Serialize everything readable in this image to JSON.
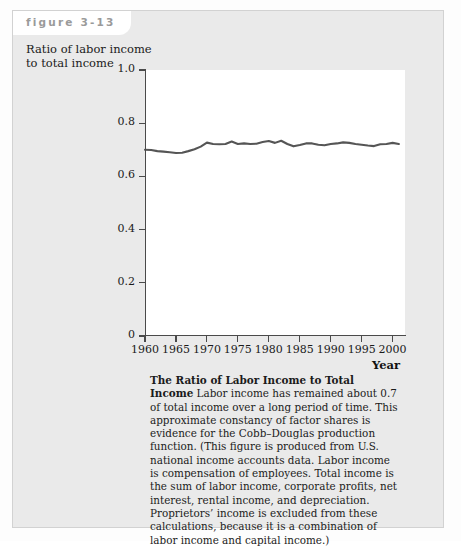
{
  "figure": {
    "label": "figure 3-13"
  },
  "axis_title_y": "Ratio of labor income\nto total income",
  "axis_title_x": "Year",
  "caption": {
    "lead": "The Ratio of Labor Income to Total Income",
    "body": " Labor income has remained about 0.7 of total income over a long period of time. This approximate constancy of factor shares is evidence for the Cobb–Douglas production function. (This figure is produced from U.S. national income accounts data. Labor income is compensation of employees. Total income is the sum of labor income, corporate profits, net interest, rental income, and depreciation. Proprietors’ income is excluded from these calculations, because it is a combination of labor income and capital income.)"
  },
  "colors": {
    "panel_background": "#eaeaea",
    "plot_background": "#ffffff",
    "axis": "#4a4a4a",
    "line": "#555555",
    "figure_label": "#9a9a9a"
  },
  "chart_data": {
    "type": "line",
    "title": "The Ratio of Labor Income to Total Income",
    "xlabel": "Year",
    "ylabel": "Ratio of labor income to total income",
    "xlim": [
      1960,
      2002
    ],
    "ylim": [
      0,
      1.0
    ],
    "grid": false,
    "legend": "none",
    "xticks": [
      1960,
      1965,
      1970,
      1975,
      1980,
      1985,
      1990,
      1995,
      2000
    ],
    "xticklabels": [
      "1960",
      "1965",
      "1970",
      "1975",
      "1980",
      "1985",
      "1990",
      "1995",
      "2000"
    ],
    "yticks": [
      0,
      0.2,
      0.4,
      0.6,
      0.8,
      1.0
    ],
    "yticklabels": [
      "0",
      "0.2",
      "0.4",
      "0.6",
      "0.8",
      "1.0"
    ],
    "series": [
      {
        "name": "Labor income share",
        "x": [
          1960,
          1961,
          1962,
          1963,
          1964,
          1965,
          1966,
          1967,
          1968,
          1969,
          1970,
          1971,
          1972,
          1973,
          1974,
          1975,
          1976,
          1977,
          1978,
          1979,
          1980,
          1981,
          1982,
          1983,
          1984,
          1985,
          1986,
          1987,
          1988,
          1989,
          1990,
          1991,
          1992,
          1993,
          1994,
          1995,
          1996,
          1997,
          1998,
          1999,
          2000,
          2001
        ],
        "values": [
          0.7,
          0.699,
          0.695,
          0.693,
          0.691,
          0.688,
          0.689,
          0.695,
          0.702,
          0.712,
          0.727,
          0.722,
          0.721,
          0.722,
          0.731,
          0.722,
          0.724,
          0.722,
          0.723,
          0.729,
          0.733,
          0.726,
          0.734,
          0.722,
          0.713,
          0.718,
          0.724,
          0.724,
          0.719,
          0.717,
          0.722,
          0.724,
          0.728,
          0.726,
          0.722,
          0.719,
          0.716,
          0.714,
          0.721,
          0.722,
          0.726,
          0.722
        ]
      }
    ]
  }
}
